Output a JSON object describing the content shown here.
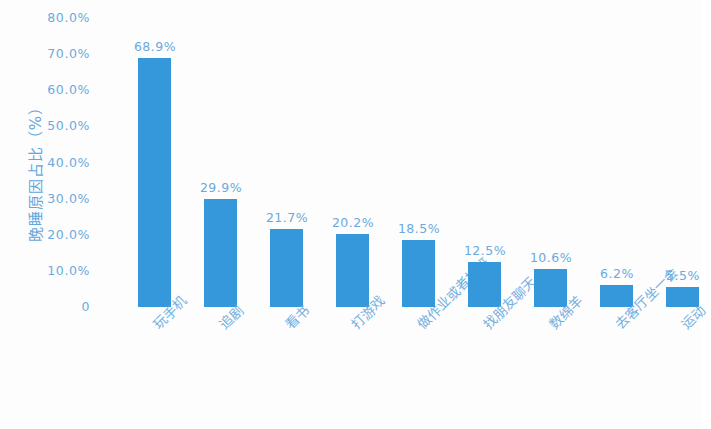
{
  "chart_data": {
    "type": "bar",
    "title": "",
    "subtitle": "",
    "xlabel": "",
    "ylabel": "晚睡原因占比（%）",
    "ylim": [
      0,
      80
    ],
    "y_tick_labels": [
      "80.0%",
      "70.0%",
      "60.0%",
      "50.0%",
      "40.0%",
      "30.0%",
      "20.0%",
      "10.0%",
      "0"
    ],
    "y_tick_values": [
      80,
      70,
      60,
      50,
      40,
      30,
      20,
      10,
      0
    ],
    "grid": false,
    "legend": false,
    "legend_position": "none",
    "bar_color": "#3498db",
    "text_color": "#6aaade",
    "categories": [
      "玩手机",
      "追剧",
      "看书",
      "打游戏",
      "做作业或者加班",
      "找朋友聊天",
      "数绵羊",
      "去客厅坐一会",
      "运动"
    ],
    "values": [
      68.9,
      29.9,
      21.7,
      20.2,
      18.5,
      12.5,
      10.6,
      6.2,
      5.5
    ],
    "value_labels": [
      "68.9%",
      "29.9%",
      "21.7%",
      "20.2%",
      "18.5%",
      "12.5%",
      "10.6%",
      "6.2%",
      "5.5%"
    ]
  }
}
